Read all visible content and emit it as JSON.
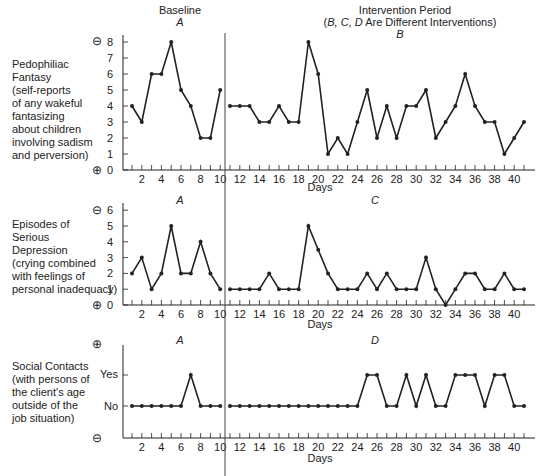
{
  "chart_data": [
    {
      "type": "line",
      "title": "Pedophiliac Fantasy",
      "ylabel": "Pedophiliac Fantasy (self-reports of any wakeful fantasizing about children involving sadism and perversion)",
      "xlabel": "Days",
      "ylim": [
        0,
        8
      ],
      "yticks": [
        0,
        1,
        2,
        3,
        4,
        5,
        6,
        7,
        8
      ],
      "y_top_symbol": "minus (undesirable)",
      "y_bottom_symbol": "plus (desirable)",
      "phases": [
        {
          "name": "Baseline",
          "label": "A",
          "days": [
            1,
            2,
            3,
            4,
            5,
            6,
            7,
            8,
            9,
            10
          ],
          "values": [
            4,
            3,
            6,
            6,
            8,
            5,
            4,
            2,
            2,
            5
          ]
        },
        {
          "name": "Intervention Period",
          "label": "B",
          "days": [
            11,
            12,
            13,
            14,
            15,
            16,
            17,
            18,
            19,
            20,
            21,
            22,
            23,
            24,
            25,
            26,
            27,
            28,
            29,
            30,
            31,
            32,
            33,
            34,
            35,
            36,
            37,
            38,
            39,
            40,
            41
          ],
          "values": [
            4,
            4,
            4,
            3,
            3,
            4,
            3,
            3,
            8,
            6,
            1,
            2,
            1,
            3,
            5,
            2,
            4,
            2,
            4,
            4,
            5,
            2,
            3,
            4,
            6,
            4,
            3,
            3,
            1,
            2,
            3
          ]
        }
      ]
    },
    {
      "type": "line",
      "title": "Episodes of Serious Depression",
      "ylabel": "Episodes of Serious Depression (crying combined with feelings of personal inadequacy)",
      "xlabel": "Days",
      "ylim": [
        0,
        6
      ],
      "yticks": [
        0,
        1,
        2,
        3,
        4,
        5,
        6
      ],
      "y_top_symbol": "minus (undesirable)",
      "y_bottom_symbol": "plus (desirable)",
      "phases": [
        {
          "name": "Baseline",
          "label": "A",
          "days": [
            1,
            2,
            3,
            4,
            5,
            6,
            7,
            8,
            9,
            10
          ],
          "values": [
            2,
            3,
            1,
            2,
            5,
            2,
            2,
            4,
            2,
            1
          ]
        },
        {
          "name": "Intervention Period",
          "label": "C",
          "days": [
            11,
            12,
            13,
            14,
            15,
            16,
            17,
            18,
            19,
            20,
            21,
            22,
            23,
            24,
            25,
            26,
            27,
            28,
            29,
            30,
            31,
            32,
            33,
            34,
            35,
            36,
            37,
            38,
            39,
            40,
            41
          ],
          "values": [
            1,
            1,
            1,
            1,
            2,
            1,
            1,
            1,
            5,
            3.5,
            2,
            1,
            1,
            1,
            2,
            1,
            2,
            1,
            1,
            1,
            3,
            1,
            0,
            1,
            2,
            2,
            1,
            1,
            2,
            1,
            1
          ]
        }
      ]
    },
    {
      "type": "line",
      "title": "Social Contacts",
      "ylabel": "Social Contacts (with persons of the client's age outside of the job situation)",
      "xlabel": "Days",
      "yticks": [
        "No",
        "Yes"
      ],
      "value_encoding": {
        "0": "No",
        "1": "Yes"
      },
      "y_top_symbol": "plus (desirable)",
      "y_bottom_symbol": "minus (undesirable)",
      "phases": [
        {
          "name": "Baseline",
          "label": "A",
          "days": [
            1,
            2,
            3,
            4,
            5,
            6,
            7,
            8,
            9,
            10
          ],
          "values": [
            0,
            0,
            0,
            0,
            0,
            0,
            1,
            0,
            0,
            0
          ]
        },
        {
          "name": "Intervention Period",
          "label": "D",
          "days": [
            11,
            12,
            13,
            14,
            15,
            16,
            17,
            18,
            19,
            20,
            21,
            22,
            23,
            24,
            25,
            26,
            27,
            28,
            29,
            30,
            31,
            32,
            33,
            34,
            35,
            36,
            37,
            38,
            39,
            40,
            41
          ],
          "values": [
            0,
            0,
            0,
            0,
            0,
            0,
            0,
            0,
            0,
            0,
            0,
            0,
            0,
            0,
            1,
            1,
            0,
            0,
            1,
            0,
            1,
            0,
            0,
            1,
            1,
            1,
            0,
            1,
            1,
            0,
            0
          ]
        }
      ]
    }
  ],
  "header": {
    "baseline_title": "Baseline",
    "intervention_title": "Intervention Period",
    "intervention_subtitle_italic": "B, C, D",
    "intervention_subtitle_rest": " Are Different Interventions)",
    "intervention_subtitle_open": "("
  },
  "panels": [
    {
      "label_lines": [
        "Pedophiliac",
        "Fantasy",
        "(self-reports",
        "of any wakeful",
        "fantasizing",
        "about children",
        "involving sadism",
        "and perversion)"
      ],
      "phase_a": "A",
      "phase_b": "B",
      "top_symbol": "⊖",
      "bottom_symbol": "⊕"
    },
    {
      "label_lines": [
        "Episodes of",
        "Serious",
        "Depression",
        "(crying combined",
        "with feelings of",
        "personal inadequacy)"
      ],
      "phase_a": "A",
      "phase_b": "C",
      "top_symbol": "⊖",
      "bottom_symbol": "⊕"
    },
    {
      "label_lines": [
        "Social Contacts",
        "(with persons of",
        "the client's age",
        "outside of the",
        "job situation)"
      ],
      "phase_a": "A",
      "phase_b": "D",
      "top_symbol": "⊕",
      "bottom_symbol": "⊖",
      "ytick_yes": "Yes",
      "ytick_no": "No"
    }
  ],
  "x_axis": {
    "label": "Days",
    "tick_labels": [
      "2",
      "4",
      "6",
      "8",
      "10",
      "12",
      "14",
      "16",
      "18",
      "20",
      "22",
      "24",
      "26",
      "28",
      "30",
      "32",
      "34",
      "36",
      "38",
      "40"
    ]
  }
}
